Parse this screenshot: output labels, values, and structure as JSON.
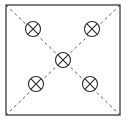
{
  "figure": {
    "title": "Square enclosure with dashed diagonals and five crossed-circle fixtures",
    "caption": "",
    "width": 127,
    "height": 123,
    "background_color": "#ffffff"
  },
  "colors": {
    "outline": "#2b2b2b",
    "diagonal": "#5a5a5a",
    "symbol_stroke": "#2b2b2b",
    "symbol_fill": "#ffffff",
    "background": "#ffffff"
  },
  "boundary": {
    "name": "room-outline",
    "shape": "rectangle",
    "x": 6,
    "y": 5,
    "width": 114,
    "height": 110,
    "stroke_width": 1.2,
    "fill": "none",
    "corners": [
      {
        "label": "top-left",
        "x": 6,
        "y": 5
      },
      {
        "label": "top-right",
        "x": 120,
        "y": 5
      },
      {
        "label": "bottom-right",
        "x": 120,
        "y": 115
      },
      {
        "label": "bottom-left",
        "x": 6,
        "y": 115
      }
    ]
  },
  "diagonals": {
    "style": "dashed",
    "dash_pattern": "3 3",
    "stroke_width": 1,
    "lines": [
      {
        "name": "diagonal-top-left-to-bottom-right",
        "x1": 6,
        "y1": 5,
        "x2": 120,
        "y2": 115
      },
      {
        "name": "diagonal-top-right-to-bottom-left",
        "x1": 120,
        "y1": 5,
        "x2": 6,
        "y2": 115
      }
    ]
  },
  "symbols": {
    "glyph": "crossed-circle",
    "glyph_unicode": "⊗",
    "radius": 7.5,
    "stroke_width": 1.1,
    "count": 5,
    "items": [
      {
        "name": "fixture-top-left",
        "position_label": "top-left",
        "cx": 33,
        "cy": 29
      },
      {
        "name": "fixture-top-right",
        "position_label": "top-right",
        "cx": 92,
        "cy": 29
      },
      {
        "name": "fixture-center",
        "position_label": "center",
        "cx": 63,
        "cy": 60
      },
      {
        "name": "fixture-bottom-left",
        "position_label": "bottom-left",
        "cx": 36,
        "cy": 84
      },
      {
        "name": "fixture-bottom-right",
        "position_label": "bottom-right",
        "cx": 90,
        "cy": 84
      }
    ]
  }
}
